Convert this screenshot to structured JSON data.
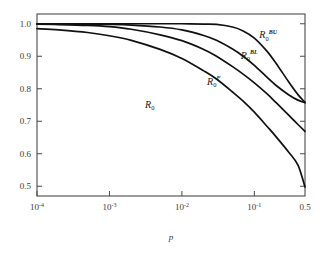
{
  "chart_data": {
    "type": "line",
    "title": "",
    "xlabel": "p",
    "ylabel": "",
    "xscale": "log",
    "xlim": [
      0.0001,
      0.5
    ],
    "ylim": [
      0.47,
      1.03
    ],
    "grid": false,
    "legend": "inline-curve-labels",
    "xticks": [
      {
        "value": 0.0001,
        "label": "10",
        "exponent": "-4"
      },
      {
        "value": 0.001,
        "label": "10",
        "exponent": "-3"
      },
      {
        "value": 0.01,
        "label": "10",
        "exponent": "-2"
      },
      {
        "value": 0.1,
        "label": "10",
        "exponent": "-1"
      },
      {
        "value": 0.5,
        "label": "0.5",
        "exponent": ""
      }
    ],
    "yticks": [
      {
        "value": 0.5,
        "label": "0.5"
      },
      {
        "value": 0.6,
        "label": "0.6"
      },
      {
        "value": 0.7,
        "label": "0.7"
      },
      {
        "value": 0.8,
        "label": "0.8"
      },
      {
        "value": 0.9,
        "label": "0.9"
      },
      {
        "value": 1.0,
        "label": "1.0"
      }
    ],
    "series": [
      {
        "name": "R_0^{BU}",
        "base": "R",
        "subscript": "0",
        "superscript": "BU",
        "label_x": 0.155,
        "label_y": 0.955,
        "x": [
          0.0001,
          0.0002,
          0.0005,
          0.001,
          0.002,
          0.005,
          0.01,
          0.02,
          0.03,
          0.05,
          0.07,
          0.1,
          0.15,
          0.2,
          0.3,
          0.4,
          0.5
        ],
        "y": [
          1.0,
          1.0,
          1.0,
          1.0,
          1.0,
          1.0,
          1.0,
          0.999,
          0.998,
          0.99,
          0.978,
          0.956,
          0.915,
          0.878,
          0.82,
          0.782,
          0.758
        ]
      },
      {
        "name": "R_0^{BL}",
        "base": "R",
        "subscript": "0",
        "superscript": "BL",
        "label_x": 0.085,
        "label_y": 0.893,
        "x": [
          0.0001,
          0.0002,
          0.0005,
          0.001,
          0.002,
          0.005,
          0.01,
          0.02,
          0.03,
          0.05,
          0.07,
          0.1,
          0.15,
          0.2,
          0.3,
          0.4,
          0.5
        ],
        "y": [
          0.9995,
          0.9993,
          0.9988,
          0.998,
          0.996,
          0.99,
          0.981,
          0.964,
          0.949,
          0.922,
          0.9,
          0.872,
          0.835,
          0.81,
          0.781,
          0.765,
          0.757
        ]
      },
      {
        "name": "R_0^{F}",
        "base": "R",
        "subscript": "0",
        "superscript": "F",
        "label_x": 0.0275,
        "label_y": 0.812,
        "x": [
          0.0001,
          0.0002,
          0.0005,
          0.001,
          0.002,
          0.005,
          0.01,
          0.02,
          0.03,
          0.05,
          0.07,
          0.1,
          0.15,
          0.2,
          0.3,
          0.4,
          0.5
        ],
        "y": [
          0.9985,
          0.9975,
          0.995,
          0.991,
          0.983,
          0.966,
          0.948,
          0.921,
          0.9,
          0.868,
          0.845,
          0.818,
          0.784,
          0.757,
          0.718,
          0.69,
          0.669
        ]
      },
      {
        "name": "R_0",
        "base": "R",
        "subscript": "0",
        "superscript": "",
        "label_x": 0.0036,
        "label_y": 0.742,
        "x": [
          0.0001,
          0.0002,
          0.0005,
          0.001,
          0.002,
          0.005,
          0.01,
          0.02,
          0.03,
          0.05,
          0.07,
          0.1,
          0.15,
          0.2,
          0.3,
          0.4,
          0.5
        ],
        "y": [
          0.985,
          0.981,
          0.973,
          0.963,
          0.949,
          0.921,
          0.893,
          0.855,
          0.83,
          0.79,
          0.762,
          0.728,
          0.684,
          0.652,
          0.604,
          0.565,
          0.498
        ]
      }
    ]
  }
}
